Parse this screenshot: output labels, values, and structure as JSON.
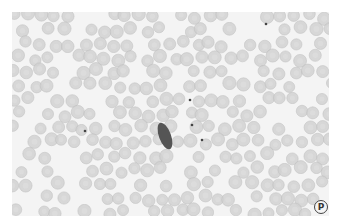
{
  "figure": {
    "panel_label": "P",
    "colors": {
      "background": "#f4f4f4",
      "cell": "#d2d2d2",
      "cell_edge": "#bdbdbd",
      "parasite": "#555555",
      "dot": "#444444"
    },
    "parasite": {
      "cx": 153,
      "cy": 124,
      "rx": 6,
      "ry": 14,
      "rotate": -20
    },
    "dots": [
      [
        178,
        88
      ],
      [
        190,
        128
      ],
      [
        180,
        113
      ],
      [
        73,
        119
      ],
      [
        254,
        12
      ]
    ]
  }
}
